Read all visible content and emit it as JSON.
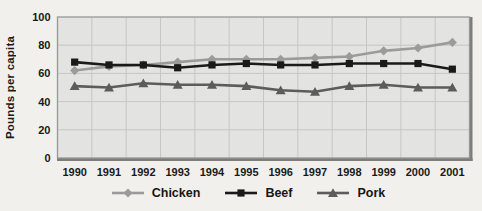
{
  "chart_data": {
    "type": "line",
    "title": "",
    "xlabel": "",
    "ylabel": "Pounds per capita",
    "x": [
      "1990",
      "1991",
      "1992",
      "1993",
      "1994",
      "1995",
      "1996",
      "1997",
      "1998",
      "1999",
      "2000",
      "2001"
    ],
    "series": [
      {
        "name": "Chicken",
        "marker": "diamond",
        "color": "#9b9b9b",
        "values": [
          62,
          65,
          66,
          68,
          70,
          70,
          70,
          71,
          72,
          76,
          78,
          82
        ]
      },
      {
        "name": "Beef",
        "marker": "square",
        "color": "#1a1a1a",
        "values": [
          68,
          66,
          66,
          64,
          66,
          67,
          66,
          66,
          67,
          67,
          67,
          63
        ]
      },
      {
        "name": "Pork",
        "marker": "triangle",
        "color": "#5c5c5c",
        "values": [
          51,
          50,
          53,
          52,
          52,
          51,
          48,
          47,
          51,
          52,
          50,
          50
        ]
      }
    ],
    "ylim": [
      0,
      100
    ],
    "yticks": [
      0,
      20,
      40,
      60,
      80,
      100
    ],
    "grid": true,
    "legend_position": "bottom",
    "colors": {
      "plot_background": "#e3e3e1",
      "grid_line": "#c6c6c4",
      "plot_border": "#979797",
      "plot_shadow": "#7c7c7c",
      "tick_text": "#1a1a1a",
      "page_background": "#f1f0ed"
    }
  }
}
